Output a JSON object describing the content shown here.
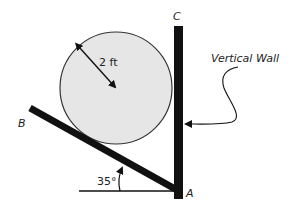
{
  "diagram": {
    "type": "statics-free-body-setup",
    "labels": {
      "point_a": "A",
      "point_b": "B",
      "point_c": "C",
      "wall": "Vertical Wall",
      "radius": "2 ft",
      "angle": "35°"
    },
    "colors": {
      "cylinder_fill": "#e6e6e6",
      "cylinder_stroke": "#333333",
      "members": "#111111",
      "text": "#222222"
    },
    "geometry": {
      "cylinder": {
        "cx": 116,
        "cy": 88,
        "r": 56
      },
      "wall": {
        "x": 174,
        "y_top": 26,
        "width": 9,
        "y_bottom": 199
      },
      "bar": {
        "x1": 30,
        "y1": 108,
        "x2": 177,
        "y2": 190,
        "thickness": 7
      },
      "ground_line": {
        "x1": 79,
        "x2": 178,
        "y": 191
      },
      "angle_degrees": 35,
      "radius_ft": 2
    }
  }
}
